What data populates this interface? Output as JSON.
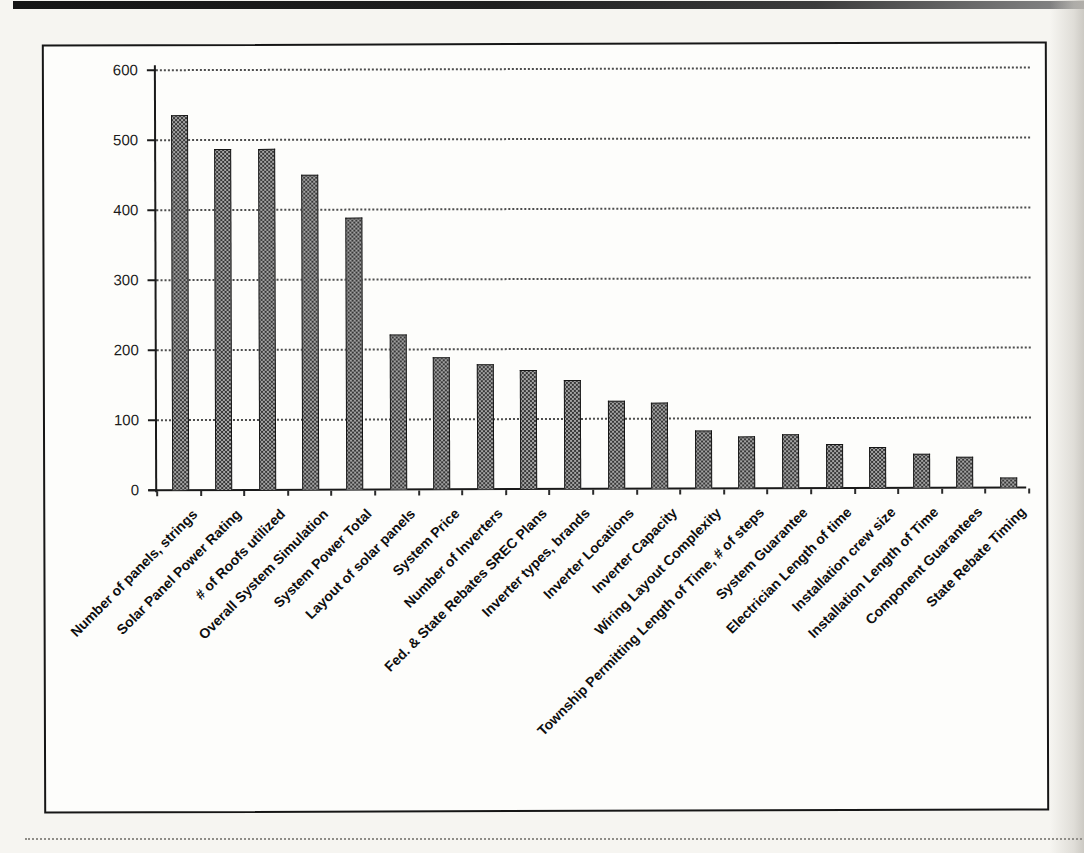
{
  "page": {
    "background": "#f6f5f1",
    "frame_border_color": "#161616"
  },
  "chart_data": {
    "type": "bar",
    "title": "",
    "xlabel": "",
    "ylabel": "",
    "ylim": [
      0,
      600
    ],
    "yticks": [
      0,
      100,
      200,
      300,
      400,
      500,
      600
    ],
    "grid": "horizontal-dotted",
    "legend": "none",
    "bar_fill": "#a3a3a3",
    "bar_halftone_dot": "#383838",
    "bar_border": "#161616",
    "categories": [
      "Number of panels, strings",
      "Solar Panel Power Rating",
      "# of Roofs utilized",
      "Overall System Simulation",
      "System Power Total",
      "Layout of solar panels",
      "System Price",
      "Number of Inverters",
      "Fed. & State Rebates SREC Plans",
      "Inverter types, brands",
      "Inverter Locations",
      "Inverter Capacity",
      "Wiring Layout Complexity",
      "Township Permitting Length of Time, # of steps",
      "System Guarantee",
      "Electrician Length of time",
      "Installation crew size",
      "Installation Length of Time",
      "Component Guarantees",
      "State Rebate Timing"
    ],
    "values": [
      535,
      487,
      487,
      450,
      388,
      222,
      188,
      178,
      170,
      155,
      125,
      123,
      83,
      74,
      77,
      63,
      58,
      48,
      45,
      14
    ]
  }
}
